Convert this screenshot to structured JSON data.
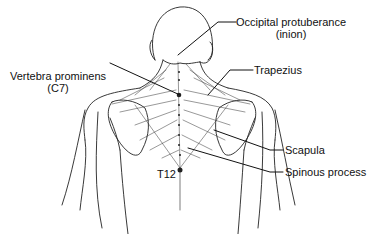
{
  "diagram": {
    "labels": {
      "occipital": {
        "line1": "Occipital protuberance",
        "line2": "(inion)"
      },
      "vertebra": {
        "line1": "Vertebra prominens",
        "line2": "(C7)"
      },
      "trapezius": {
        "line1": "Trapezius"
      },
      "scapula": {
        "line1": "Scapula"
      },
      "spinous": {
        "line1": "Spinous process"
      },
      "t12": {
        "line1": "T12"
      }
    },
    "colors": {
      "ink": "#111111",
      "background": "#ffffff"
    }
  }
}
